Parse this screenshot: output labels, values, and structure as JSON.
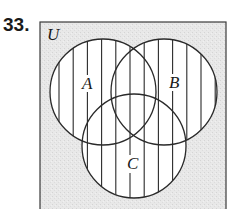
{
  "problem": {
    "number": "33."
  },
  "diagram": {
    "universe_label": "U",
    "sets": [
      {
        "label": "A",
        "cx": 103,
        "cy": 92,
        "r": 53,
        "label_x": 88,
        "label_y": 89
      },
      {
        "label": "B",
        "cx": 164,
        "cy": 92,
        "r": 53,
        "label_x": 175,
        "label_y": 88
      },
      {
        "label": "C",
        "cx": 134,
        "cy": 146,
        "r": 52,
        "label_x": 133,
        "label_y": 169
      }
    ],
    "shaded_region": "A ∪ B ∪ C",
    "shading_style": "vertical-hatch",
    "colors": {
      "universe_fill": "#e6e6e6",
      "region_fill": "#ffffff",
      "stroke": "#2a2a2a"
    }
  }
}
